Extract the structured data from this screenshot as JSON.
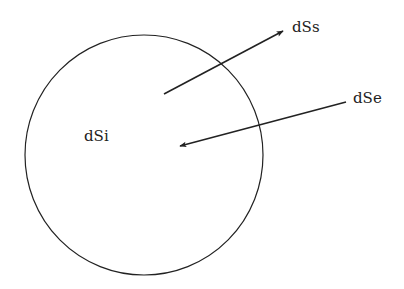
{
  "diagram": {
    "labels": {
      "inner": "dSi",
      "outgoing": "dSs",
      "incoming": "dSe"
    },
    "colors": {
      "stroke": "#222222",
      "background": "#ffffff"
    }
  }
}
